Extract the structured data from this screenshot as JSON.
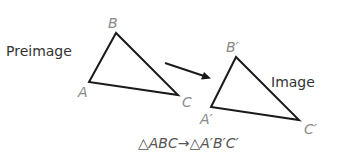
{
  "diagram": {
    "colors": {
      "lines": "#1a1a1a",
      "vertex_labels": "#8a8a8a",
      "captions": "#333333",
      "notation": "#555555"
    },
    "preimage": {
      "caption": "Preimage",
      "vertices": [
        {
          "label": "A",
          "x": 89,
          "y": 82
        },
        {
          "label": "B",
          "x": 116,
          "y": 33
        },
        {
          "label": "C",
          "x": 178,
          "y": 95
        }
      ]
    },
    "image": {
      "caption": "Image",
      "vertices": [
        {
          "label": "A′",
          "x": 211,
          "y": 107
        },
        {
          "label": "B′",
          "x": 236,
          "y": 57
        },
        {
          "label": "C′",
          "x": 299,
          "y": 120
        }
      ]
    },
    "arrow": {
      "x1": 165,
      "y1": 63,
      "x2": 210,
      "y2": 78
    },
    "notation": "△ABC→△A′B′C′"
  }
}
